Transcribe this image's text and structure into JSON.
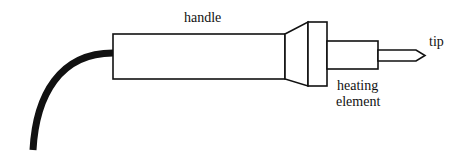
{
  "diagram": {
    "labels": {
      "handle": "handle",
      "tip": "tip",
      "heating_element_line1": "heating",
      "heating_element_line2": "element"
    },
    "colors": {
      "stroke": "#111111",
      "cord": "#111111",
      "background": "#ffffff"
    }
  }
}
